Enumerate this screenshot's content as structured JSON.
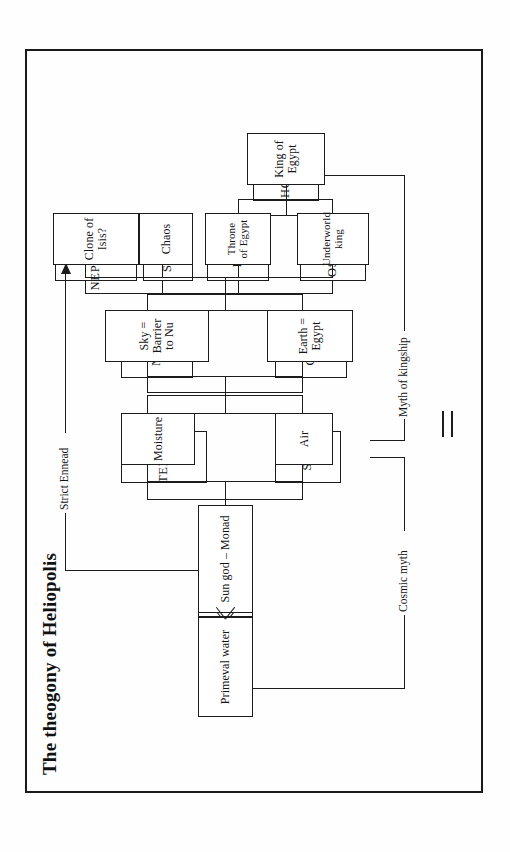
{
  "figure": {
    "title": "The theogony of Heliopolis",
    "panels": [
      {
        "id": "names",
        "nodes": {
          "nu": "NU",
          "atum": "ATUM",
          "shu": "SHU",
          "tefnut": "TEFNUT",
          "geb": "GEB",
          "nut": "NUT",
          "osiris": "OSIRIS",
          "isis": "ISIS",
          "seth": "SETH",
          "nephthys": "NEPHTHYS",
          "horus": "HORUS"
        },
        "labels": {
          "cosmic_myth": "Cosmic myth",
          "myth_of_kingship": "Myth of kingship",
          "strict_ennead": "Strict Ennead"
        }
      },
      {
        "id": "glosses",
        "nodes": {
          "nu": "Primeval water",
          "atum": "Sun god – Monad",
          "shu": "Air",
          "tefnut": "Moisture",
          "geb": "Earth = Egypt",
          "nut": "Sky = Barrier to Nu",
          "osiris": "Underworld king",
          "isis": "Throne of Egypt",
          "seth": "Chaos",
          "nephthys": "Clone of Isis?",
          "horus": "King of Egypt"
        }
      }
    ],
    "relation_symbol": "=",
    "colors": {
      "ink": "#1c1c1c",
      "paper": "#ffffff"
    }
  }
}
